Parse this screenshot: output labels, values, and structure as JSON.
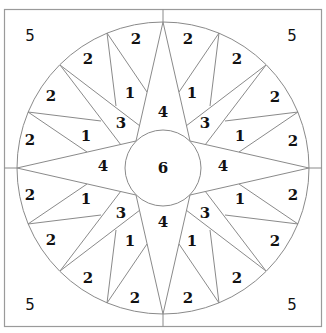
{
  "diagram": {
    "colors": {
      "line": "#8a8a8a",
      "frame": "#9a9a9a",
      "text": "#111111",
      "background": "#ffffff"
    },
    "geometry": {
      "center": [
        163,
        168
      ],
      "outer_radius": 146,
      "inner_radius": 38,
      "frame": [
        4,
        9,
        322,
        327
      ]
    },
    "pieces": {
      "corners": [
        {
          "label": "5",
          "x": 30,
          "y": 36
        },
        {
          "label": "5",
          "x": 292,
          "y": 36
        },
        {
          "label": "5",
          "x": 30,
          "y": 305
        },
        {
          "label": "5",
          "x": 292,
          "y": 305
        }
      ],
      "center": {
        "label": "6",
        "x": 163,
        "y": 168
      },
      "long_points": [
        {
          "label": "4",
          "x": 163,
          "y": 112
        },
        {
          "label": "4",
          "x": 103,
          "y": 166
        },
        {
          "label": "4",
          "x": 223,
          "y": 166
        },
        {
          "label": "4",
          "x": 163,
          "y": 222
        }
      ],
      "diagonal_points": [
        {
          "label": "3",
          "x": 121,
          "y": 123
        },
        {
          "label": "3",
          "x": 205,
          "y": 123
        },
        {
          "label": "3",
          "x": 121,
          "y": 213
        },
        {
          "label": "3",
          "x": 205,
          "y": 213
        }
      ],
      "small_points": [
        {
          "label": "1",
          "x": 130,
          "y": 93
        },
        {
          "label": "1",
          "x": 192,
          "y": 93
        },
        {
          "label": "1",
          "x": 86,
          "y": 136
        },
        {
          "label": "1",
          "x": 240,
          "y": 136
        },
        {
          "label": "1",
          "x": 86,
          "y": 199
        },
        {
          "label": "1",
          "x": 240,
          "y": 199
        },
        {
          "label": "1",
          "x": 130,
          "y": 241
        },
        {
          "label": "1",
          "x": 192,
          "y": 241
        }
      ],
      "background_wedges": [
        {
          "label": "2",
          "x": 136,
          "y": 39
        },
        {
          "label": "2",
          "x": 188,
          "y": 39
        },
        {
          "label": "2",
          "x": 88,
          "y": 59
        },
        {
          "label": "2",
          "x": 237,
          "y": 59
        },
        {
          "label": "2",
          "x": 51,
          "y": 96
        },
        {
          "label": "2",
          "x": 275,
          "y": 97
        },
        {
          "label": "2",
          "x": 30,
          "y": 140
        },
        {
          "label": "2",
          "x": 293,
          "y": 141
        },
        {
          "label": "2",
          "x": 30,
          "y": 195
        },
        {
          "label": "2",
          "x": 293,
          "y": 195
        },
        {
          "label": "2",
          "x": 51,
          "y": 240
        },
        {
          "label": "2",
          "x": 275,
          "y": 241
        },
        {
          "label": "2",
          "x": 88,
          "y": 278
        },
        {
          "label": "2",
          "x": 237,
          "y": 278
        },
        {
          "label": "2",
          "x": 135,
          "y": 298
        },
        {
          "label": "2",
          "x": 188,
          "y": 298
        }
      ]
    }
  }
}
